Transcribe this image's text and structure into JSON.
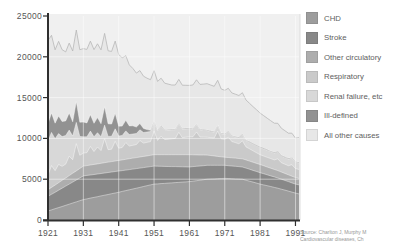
{
  "source": {
    "line1": "Source: Charlton J, Murphy M",
    "line2": "Cardiovascular diseases, Ch"
  },
  "colors": {
    "plot_background": "#f0f0f0",
    "axis": "#2f2f2f",
    "gridline": "#ffffff",
    "tick_label": "#565656",
    "top_edge_line": "#b8b8b8",
    "right_border": "#dddddd"
  },
  "chart_data": {
    "type": "area",
    "stacked": true,
    "title": "",
    "xlabel": "",
    "ylabel": "",
    "legend_position": "right",
    "grid": true,
    "ylim": [
      0,
      25000
    ],
    "yticks": [
      0,
      5000,
      10000,
      15000,
      20000,
      25000
    ],
    "ytick_labels": [
      "0",
      "5000",
      "10000",
      "15000",
      "20000",
      "25000"
    ],
    "xticks": [
      1921,
      1931,
      1941,
      1951,
      1961,
      1971,
      1981,
      1991
    ],
    "x": [
      1921,
      1922,
      1923,
      1924,
      1925,
      1926,
      1927,
      1928,
      1929,
      1930,
      1931,
      1932,
      1933,
      1934,
      1935,
      1936,
      1937,
      1938,
      1939,
      1940,
      1941,
      1942,
      1943,
      1944,
      1945,
      1946,
      1947,
      1948,
      1949,
      1950,
      1951,
      1952,
      1953,
      1954,
      1955,
      1956,
      1957,
      1958,
      1959,
      1960,
      1961,
      1962,
      1963,
      1964,
      1965,
      1966,
      1967,
      1968,
      1969,
      1970,
      1971,
      1972,
      1973,
      1974,
      1975,
      1976,
      1977,
      1978,
      1979,
      1980,
      1981,
      1982,
      1983,
      1984,
      1985,
      1986,
      1987,
      1988,
      1989,
      1990,
      1991,
      1992
    ],
    "series": [
      {
        "name": "CHD",
        "color": "#9d9d9d",
        "values": [
          1100,
          1240,
          1380,
          1520,
          1660,
          1800,
          1940,
          2080,
          2220,
          2360,
          2500,
          2590,
          2680,
          2770,
          2860,
          2950,
          3040,
          3130,
          3220,
          3310,
          3400,
          3500,
          3600,
          3700,
          3800,
          3900,
          4000,
          4100,
          4200,
          4300,
          4400,
          4430,
          4460,
          4490,
          4520,
          4550,
          4580,
          4610,
          4640,
          4670,
          4700,
          4760,
          4820,
          4880,
          4940,
          5000,
          5020,
          5040,
          5060,
          5080,
          5100,
          5080,
          5060,
          5040,
          5020,
          5000,
          4880,
          4760,
          4640,
          4520,
          4400,
          4300,
          4200,
          4100,
          4000,
          3900,
          3780,
          3660,
          3540,
          3420,
          3300,
          3200
        ]
      },
      {
        "name": "Stroke",
        "color": "#888888",
        "values": [
          1800,
          1910,
          2020,
          2130,
          2240,
          2350,
          2460,
          2570,
          2680,
          2790,
          2900,
          2870,
          2840,
          2810,
          2780,
          2750,
          2720,
          2690,
          2660,
          2630,
          2600,
          2560,
          2520,
          2480,
          2440,
          2400,
          2360,
          2320,
          2280,
          2240,
          2200,
          2160,
          2120,
          2080,
          2040,
          2000,
          1960,
          1920,
          1880,
          1840,
          1800,
          1780,
          1760,
          1740,
          1720,
          1700,
          1680,
          1660,
          1640,
          1620,
          1600,
          1580,
          1560,
          1540,
          1520,
          1500,
          1480,
          1460,
          1440,
          1420,
          1400,
          1370,
          1340,
          1310,
          1280,
          1250,
          1220,
          1190,
          1160,
          1130,
          1100,
          1100
        ]
      },
      {
        "name": "Other circulatory",
        "color": "#adadad",
        "values": [
          800,
          840,
          880,
          920,
          960,
          1000,
          1040,
          1080,
          1120,
          1160,
          1200,
          1210,
          1220,
          1230,
          1240,
          1250,
          1260,
          1270,
          1280,
          1290,
          1300,
          1310,
          1320,
          1330,
          1340,
          1350,
          1360,
          1370,
          1380,
          1390,
          1400,
          1410,
          1420,
          1430,
          1440,
          1450,
          1460,
          1470,
          1480,
          1490,
          1500,
          1450,
          1400,
          1350,
          1300,
          1250,
          1200,
          1150,
          1100,
          1050,
          1000,
          1000,
          1000,
          1000,
          1000,
          1000,
          1000,
          1000,
          1000,
          1000,
          1000,
          980,
          960,
          940,
          920,
          900,
          880,
          860,
          840,
          820,
          800,
          800
        ]
      },
      {
        "name": "Respiratory",
        "color": "#cacaca",
        "values": [
          1800,
          2680,
          1760,
          2240,
          1720,
          1700,
          2380,
          1660,
          3340,
          1620,
          1600,
          1590,
          2280,
          1570,
          2060,
          1550,
          2940,
          1530,
          1520,
          2410,
          1500,
          1520,
          2040,
          1560,
          1580,
          1600,
          2020,
          1640,
          1660,
          1680,
          2900,
          1750,
          2300,
          1850,
          1900,
          1950,
          2000,
          2750,
          2100,
          2150,
          2200,
          2200,
          2800,
          2200,
          2200,
          2200,
          2200,
          2200,
          3100,
          2200,
          2200,
          2500,
          2000,
          1900,
          1800,
          2200,
          1600,
          1500,
          1400,
          1300,
          1200,
          1190,
          1180,
          1170,
          1160,
          1450,
          1140,
          1130,
          1120,
          1410,
          1100,
          1100
        ]
      },
      {
        "name": "Renal failure, etc",
        "color": "#d8d8d8",
        "values": [
          4200,
          4060,
          3920,
          3780,
          3640,
          3500,
          3200,
          2900,
          2600,
          2300,
          2000,
          1940,
          1880,
          1820,
          1760,
          1700,
          1660,
          1620,
          1580,
          1540,
          1500,
          1470,
          1440,
          1410,
          1380,
          1350,
          1320,
          1290,
          1260,
          1230,
          1200,
          1180,
          1160,
          1140,
          1120,
          1100,
          1080,
          1060,
          1040,
          1020,
          1000,
          960,
          920,
          880,
          840,
          800,
          760,
          720,
          680,
          640,
          600,
          630,
          660,
          690,
          720,
          750,
          780,
          810,
          840,
          870,
          900,
          890,
          880,
          870,
          860,
          850,
          840,
          830,
          820,
          810,
          800,
          800
        ]
      },
      {
        "name": "Ill-defined",
        "color": "#929292",
        "values": [
          2100,
          2400,
          1900,
          2150,
          1850,
          1800,
          2100,
          1750,
          2550,
          1750,
          1800,
          1700,
          2000,
          1650,
          1850,
          1600,
          2250,
          1550,
          1500,
          1900,
          1200,
          1150,
          1300,
          1050,
          1000,
          800,
          750,
          500,
          300,
          150,
          80,
          80,
          80,
          80,
          80,
          80,
          80,
          80,
          80,
          80,
          80,
          80,
          80,
          80,
          80,
          80,
          80,
          80,
          80,
          80,
          80,
          80,
          80,
          80,
          80,
          80,
          80,
          80,
          80,
          80,
          80,
          80,
          80,
          80,
          80,
          80,
          80,
          80,
          80,
          80,
          80,
          80
        ]
      },
      {
        "name": "All other causes",
        "color": "#e7e7e7",
        "values": [
          10200,
          9500,
          9000,
          9150,
          8800,
          8450,
          8560,
          8670,
          8780,
          8890,
          9000,
          9010,
          9020,
          9030,
          9040,
          9050,
          9000,
          8950,
          8900,
          8850,
          8800,
          8360,
          7920,
          7480,
          7040,
          6600,
          6500,
          6400,
          6300,
          6200,
          6120,
          5980,
          5840,
          5700,
          5560,
          5420,
          5380,
          5340,
          5300,
          5260,
          5220,
          5310,
          5400,
          5490,
          5580,
          5670,
          5600,
          5530,
          5460,
          5390,
          5320,
          5270,
          5220,
          5170,
          5120,
          5070,
          4880,
          4690,
          4500,
          4310,
          4120,
          3980,
          3840,
          3700,
          3560,
          3420,
          3306,
          3192,
          3078,
          2964,
          2850,
          3020
        ]
      }
    ]
  }
}
